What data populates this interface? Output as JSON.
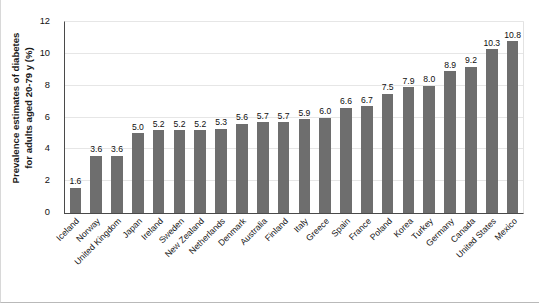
{
  "chart_data": {
    "type": "bar",
    "title": "",
    "subtitle": "",
    "xlabel": "",
    "ylabel": "Prevalence estimates of diabetes for adults aged 20-79 y (%)",
    "ylabel_line1": "Prevalence estimates of diabetes",
    "ylabel_line2": "for adults aged 20-79 y (%)",
    "ylim": [
      0,
      12
    ],
    "yticks": [
      0,
      2,
      4,
      6,
      8,
      10,
      12
    ],
    "ytick_labels": [
      "0",
      "2",
      "4",
      "6",
      "8",
      "10",
      "12"
    ],
    "grid": true,
    "grid_axis": "y",
    "legend": null,
    "bar_color": "#6e6e6e",
    "axis_color": "#4a4a4a",
    "grid_color": "#e6e6e6",
    "categories": [
      "Iceland",
      "Norway",
      "United Kingdom",
      "Japan",
      "Ireland",
      "Sweden",
      "New Zealand",
      "Netherlands",
      "Denmark",
      "Australia",
      "Finland",
      "Italy",
      "Greece",
      "Spain",
      "France",
      "Poland",
      "Korea",
      "Turkey",
      "Germany",
      "Canada",
      "United States",
      "Mexico"
    ],
    "values": [
      1.6,
      3.6,
      3.6,
      5.0,
      5.2,
      5.2,
      5.2,
      5.3,
      5.6,
      5.7,
      5.7,
      5.9,
      6.0,
      6.6,
      6.7,
      7.5,
      7.9,
      8.0,
      8.9,
      9.2,
      10.3,
      10.8
    ],
    "value_labels": [
      "1.6",
      "3.6",
      "3.6",
      "5.0",
      "5.2",
      "5.2",
      "5.2",
      "5.3",
      "5.6",
      "5.7",
      "5.7",
      "5.9",
      "6.0",
      "6.6",
      "6.7",
      "7.5",
      "7.9",
      "8.0",
      "8.9",
      "9.2",
      "10.3",
      "10.8"
    ]
  }
}
